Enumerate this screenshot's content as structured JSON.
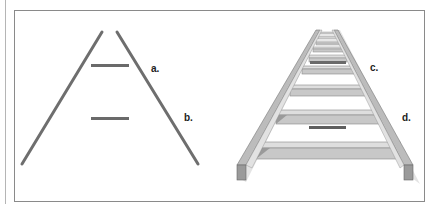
{
  "figure": {
    "left_panel": {
      "description": "Two converging lines with two equal horizontal bars (Ponzo illusion)",
      "labels": {
        "a": "a.",
        "b": "b."
      }
    },
    "right_panel": {
      "description": "Perspective ladder / railway with two equal dark bars",
      "labels": {
        "c": "c.",
        "d": "d."
      }
    },
    "colors": {
      "line": "#6e6e6e",
      "bar": "#6a6a6a",
      "ladder_light": "#dcdcdc",
      "ladder_mid": "#bdbdbd",
      "ladder_dark": "#8c8c8c",
      "frame": "#8a8a8a"
    }
  }
}
